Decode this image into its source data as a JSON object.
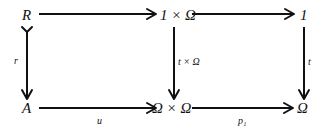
{
  "diagram": {
    "type": "commutative-square",
    "nodes": {
      "R": "R",
      "one_times_omega": "1 × Ω",
      "one": "1",
      "A": "A",
      "omega_times_omega": "Ω × Ω",
      "omega": "Ω"
    },
    "edges": [
      {
        "from": "R",
        "to": "1 × Ω",
        "label": "",
        "style": "arrow"
      },
      {
        "from": "1 × Ω",
        "to": "1",
        "label": "",
        "style": "arrow"
      },
      {
        "from": "R",
        "to": "A",
        "label": "r",
        "style": "monic-arrow"
      },
      {
        "from": "1 × Ω",
        "to": "Ω × Ω",
        "label": "t × Ω",
        "style": "arrow"
      },
      {
        "from": "1",
        "to": "Ω",
        "label": "t",
        "style": "arrow"
      },
      {
        "from": "A",
        "to": "Ω × Ω",
        "label": "u",
        "style": "arrow"
      },
      {
        "from": "Ω × Ω",
        "to": "Ω",
        "label": "p₁",
        "style": "arrow"
      }
    ]
  }
}
